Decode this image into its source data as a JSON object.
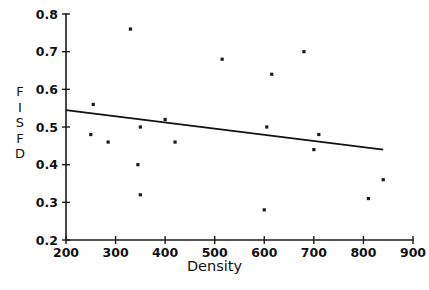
{
  "chart_data": {
    "type": "scatter",
    "title": "",
    "xlabel": "Density",
    "ylabel": "FISFD",
    "ylabel_letters": [
      "F",
      "I",
      "S",
      "F",
      "D"
    ],
    "xlim": [
      200,
      900
    ],
    "ylim": [
      0.2,
      0.8
    ],
    "xticks": [
      200,
      300,
      400,
      500,
      600,
      700,
      800,
      900
    ],
    "yticks": [
      "0.2",
      "0.3",
      "0.4",
      "0.5",
      "0.6",
      "0.7",
      "0.8"
    ],
    "xtick_labels": [
      "200",
      "300",
      "400",
      "500",
      "600",
      "700",
      "800",
      "900"
    ],
    "grid": false,
    "legend": null,
    "marker": "square",
    "marker_color": "#1b1b1b",
    "line_color": "#111111",
    "points": [
      {
        "x": 250,
        "y": 0.48
      },
      {
        "x": 255,
        "y": 0.56
      },
      {
        "x": 285,
        "y": 0.46
      },
      {
        "x": 330,
        "y": 0.76
      },
      {
        "x": 345,
        "y": 0.4
      },
      {
        "x": 350,
        "y": 0.32
      },
      {
        "x": 350,
        "y": 0.5
      },
      {
        "x": 400,
        "y": 0.52
      },
      {
        "x": 420,
        "y": 0.46
      },
      {
        "x": 515,
        "y": 0.68
      },
      {
        "x": 600,
        "y": 0.28
      },
      {
        "x": 605,
        "y": 0.5
      },
      {
        "x": 615,
        "y": 0.64
      },
      {
        "x": 680,
        "y": 0.7
      },
      {
        "x": 700,
        "y": 0.44
      },
      {
        "x": 710,
        "y": 0.48
      },
      {
        "x": 810,
        "y": 0.31
      },
      {
        "x": 840,
        "y": 0.36
      }
    ],
    "fit_line": {
      "x_start": 200,
      "y_start": 0.545,
      "x_end": 840,
      "y_end": 0.44
    }
  }
}
